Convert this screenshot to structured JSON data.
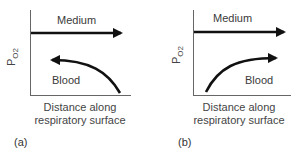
{
  "panels": [
    {
      "id": "a",
      "letter": "(a)",
      "y_axis_label": "P",
      "y_axis_subscript": "O2",
      "x_axis_label_line1": "Distance along",
      "x_axis_label_line2": "respiratory surface",
      "medium_label": "Medium",
      "medium_direction": "right",
      "blood_label": "Blood",
      "blood_direction": "left",
      "flow_type": "countercurrent"
    },
    {
      "id": "b",
      "letter": "(b)",
      "y_axis_label": "P",
      "y_axis_subscript": "O2",
      "x_axis_label_line1": "Distance along",
      "x_axis_label_line2": "respiratory surface",
      "medium_label": "Medium",
      "medium_direction": "right",
      "blood_label": "Blood",
      "blood_direction": "right",
      "flow_type": "concurrent"
    }
  ],
  "colors": {
    "line": "#111111",
    "text": "#3a3a3a",
    "axis": "#555555"
  }
}
